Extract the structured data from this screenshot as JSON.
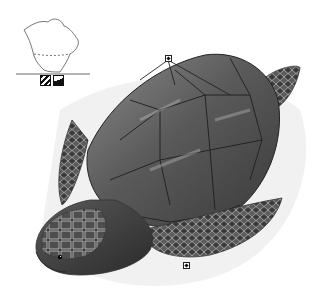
{
  "image": {
    "subject": "sea turtle illustration",
    "style": "grayscale pencil field-guide illustration",
    "background": "#ffffff"
  },
  "range_map": {
    "region": "North America outline",
    "line_color": "#555555"
  },
  "habitat_icons": [
    {
      "name": "ocean-habitat-icon"
    },
    {
      "name": "shore-habitat-icon"
    }
  ],
  "markers": [
    {
      "name": "carapace-marker",
      "x": 168,
      "y": 58
    },
    {
      "name": "flipper-marker",
      "x": 186,
      "y": 265
    }
  ],
  "colors": {
    "shell_dark": "#3c3c3c",
    "shell_mid": "#6e6e6e",
    "shell_light": "#a8a8a8",
    "skin_dark": "#2e2e2e",
    "scute_line": "#1e1e1e"
  }
}
